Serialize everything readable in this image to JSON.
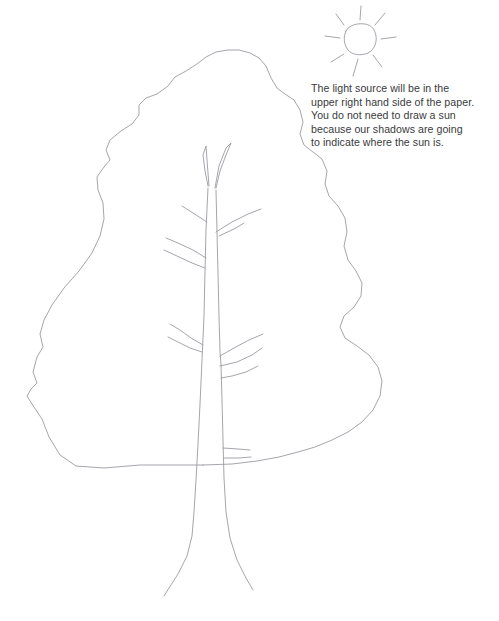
{
  "page": {
    "background_color": "#ffffff",
    "line_color": "#9b9ba3",
    "text_color": "#3a3a3c",
    "width": 499,
    "height": 621
  },
  "cut_off_header": {
    "text": ""
  },
  "instruction": {
    "line1": "The light source will be in the",
    "line2": "upper right hand side of the paper.",
    "line3": "You do not need to draw a sun",
    "line4": "because our shadows are going",
    "line5": "to indicate where the sun is.",
    "full_text": "The light source will be in the upper right hand side of the paper. You do not need to draw a sun because our shadows are going to indicate where the sun is."
  },
  "artwork": {
    "title": "Line drawing of a bare tree with canopy outline",
    "sun": {
      "name": "hand-drawn sun",
      "ray_count": 8,
      "center_x": 359,
      "center_y": 40,
      "body_radius": 16
    },
    "tree": {
      "name": "deciduous tree outline",
      "canopy_label": "canopy outline",
      "trunk_label": "trunk",
      "branch_count": 7
    }
  }
}
